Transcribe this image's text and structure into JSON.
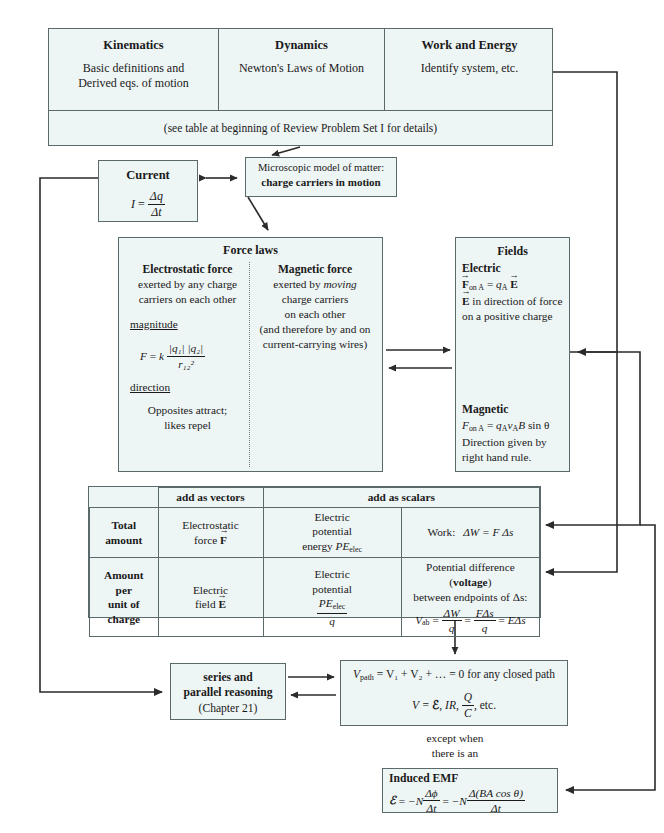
{
  "header": {
    "columns": [
      {
        "title": "Kinematics",
        "line1": "Basic definitions and",
        "line2": "Derived eqs. of motion"
      },
      {
        "title": "Dynamics",
        "line1": "Newton's Laws of Motion",
        "line2": ""
      },
      {
        "title": "Work and Energy",
        "line1": "Identify system, etc.",
        "line2": ""
      }
    ],
    "note": "(see table at beginning of Review Problem Set I for details)"
  },
  "current": {
    "title": "Current",
    "equation": "I = Δq / Δt",
    "eq_lhs": "I",
    "eq_eq": "=",
    "eq_num": "Δq",
    "eq_den": "Δt"
  },
  "microscopic": {
    "line1": "Microscopic model of matter:",
    "line2": "charge carriers in motion"
  },
  "force_laws": {
    "title": "Force laws",
    "electrostatic": {
      "title": "Electrostatic force",
      "line1": "exerted by any charge",
      "line2": "carriers on each other",
      "magnitude_label": "magnitude",
      "formula": "F = k |q₁||q₂| / r₁₂²",
      "formula_lhs": "F",
      "formula_eq": "=",
      "formula_k": "k",
      "formula_num": "|q₁| |q₂|",
      "formula_den": "r₁₂²",
      "direction_label": "direction",
      "dir_line1": "Opposites attract;",
      "dir_line2": "likes repel"
    },
    "magnetic": {
      "title": "Magnetic force",
      "line1_pre": "exerted by ",
      "line1_em": "moving",
      "line2": "charge carriers",
      "line3": "on each other",
      "line4": "(and therefore by and on",
      "line5": "current-carrying wires)"
    }
  },
  "fields": {
    "title": "Fields",
    "electric": {
      "heading": "Electric",
      "equation": "F on A = q_A E",
      "eq_f": "F",
      "eq_fsub": "on A",
      "eq_eq": "=",
      "eq_q": "q",
      "eq_qsub": "A",
      "eq_e": "E",
      "line2": "E in direction of force",
      "line2_rest": " in direction of force",
      "line3": "on a positive charge"
    },
    "magnetic": {
      "heading": "Magnetic",
      "equation": "F on A = q_A v_A B sin θ",
      "eq_f": "F",
      "eq_fsub": "on A",
      "eq_eq": "=",
      "eq_q": "q",
      "eq_qsub": "A",
      "eq_v": "v",
      "eq_vsub": "A",
      "eq_b": "B",
      "eq_sin": "sin θ",
      "line2": "Direction given by",
      "line3": "right hand rule."
    }
  },
  "table": {
    "corner": "",
    "col_headers": [
      "add as vectors",
      "add as scalars"
    ],
    "rows": [
      {
        "label_lines": [
          "Total",
          "amount"
        ],
        "vectors": [
          "Electrostatic",
          "force F"
        ],
        "vectors_l1": "Electrostatic",
        "vectors_l2_pre": "force ",
        "vectors_l2_vec": "F",
        "scalar_potential": [
          "Electric",
          "potential",
          "energy PE"
        ],
        "sp_l1": "Electric",
        "sp_l2": "potential",
        "sp_l3_pre": "energy ",
        "sp_l3_it": "PE",
        "sp_l3_sub": "elec",
        "scalar_work": "Work:  ΔW = F Δs",
        "work_label": "Work:",
        "work_eq": "ΔW = F Δs"
      },
      {
        "label_lines": [
          "Amount",
          "per",
          "unit of",
          "charge"
        ],
        "vectors": [
          "Electric",
          "field E"
        ],
        "vectors_l1": "Electric",
        "vectors_l2_pre": "field ",
        "vectors_l2_vec": "E",
        "scalar_potential": [
          "Electric",
          "potential",
          "PE elec / q"
        ],
        "sp_l1": "Electric",
        "sp_l2": "potential",
        "sp_frac_num_it": "PE",
        "sp_frac_num_sub": "elec",
        "sp_frac_den": "q",
        "pd_line1_pre": "Potential difference (",
        "pd_line1_bold": "voltage",
        "pd_line1_post": ")",
        "pd_line2": "between endpoints of Δs:",
        "pd_eq": "V_ab = ΔW/q = FΔs/q = EΔs",
        "pd_lhs": "V",
        "pd_lhs_sub": "ab",
        "pd_num1": "ΔW",
        "pd_den1": "q",
        "pd_num2": "FΔs",
        "pd_den2": "q",
        "pd_tail": "EΔs"
      }
    ]
  },
  "series": {
    "line1": "series and",
    "line2": "parallel reasoning",
    "line3": "(Chapter 21)"
  },
  "vpath": {
    "eq1": "V_path = V₁ + V₂ + … = 0 for any closed path",
    "eq1_lhs": "V",
    "eq1_lhs_sub": "path",
    "eq1_body": "= V₁ + V₂ + … = 0 for any closed path",
    "eq2": "V = ℰ, IR, Q/C, etc.",
    "eq2_lhs": "V =",
    "eq2_emf": "ℰ",
    "eq2_ir": "IR",
    "eq2_num": "Q",
    "eq2_den": "C",
    "eq2_tail": "etc."
  },
  "except_note": {
    "line1": "except when",
    "line2": "there is an"
  },
  "induced_emf": {
    "title": "Induced EMF",
    "equation": "ℰ = −N Δφ/Δt = −N Δ(BA cos θ)/Δt",
    "eq_lhs": "ℰ",
    "eq_eq1": "=",
    "eq_n1": "−N",
    "eq_num1": "Δϕ",
    "eq_den1": "Δt",
    "eq_eq2": "=",
    "eq_n2": "−N",
    "eq_num2": "Δ(BA cos θ)",
    "eq_den2": "Δt"
  },
  "colors": {
    "box_fill": "#eef5f5",
    "box_stroke": "#5a6a6a",
    "wire": "#2b2b2b",
    "text": "#1a1a1a"
  }
}
